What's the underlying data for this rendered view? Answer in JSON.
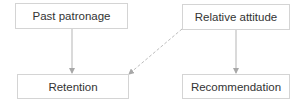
{
  "nodes": {
    "past_patronage": "Past patronage",
    "relative_attitude": "Relative attitude",
    "retention": "Retention",
    "recommendation": "Recommendation"
  },
  "edges": [
    {
      "from": "Past patronage",
      "to": "Retention",
      "style": "solid"
    },
    {
      "from": "Relative attitude",
      "to": "Recommendation",
      "style": "solid"
    },
    {
      "from": "Relative attitude",
      "to": "Retention",
      "style": "dashed"
    }
  ],
  "colors": {
    "border": "#d4d4d4",
    "line": "#b5b5b5",
    "text": "#333333"
  }
}
